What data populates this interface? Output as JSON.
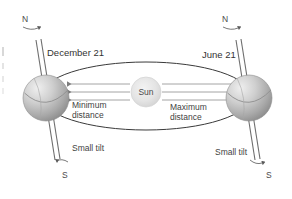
{
  "diagram": {
    "background_color": "#ffffff",
    "width": 292,
    "height": 199
  },
  "sun": {
    "label": "Sun",
    "color": "#e2e2e2",
    "edge_color": "#c9c9c9"
  },
  "earth_left": {
    "date_label": "December 21",
    "north_label": "N",
    "south_label": "S",
    "tilt_label": "Small tilt",
    "distance_label_line1": "Minimum",
    "distance_label_line2": "distance",
    "body_color": "#b8b8b8",
    "highlight_color": "#e8e8e8"
  },
  "earth_right": {
    "date_label": "June 21",
    "north_label": "N",
    "south_label": "S",
    "tilt_label": "Small tilt",
    "distance_label_line1": "Maximum",
    "distance_label_line2": "distance",
    "body_color": "#b8b8b8",
    "highlight_color": "#e8e8e8"
  },
  "orbit": {
    "stroke_color": "#3a3a3a",
    "stroke_width": 1
  },
  "rays": {
    "stroke_color": "#909090",
    "count_left": 3,
    "count_right": 3
  },
  "axis": {
    "stroke_color": "#6e6e6e"
  }
}
